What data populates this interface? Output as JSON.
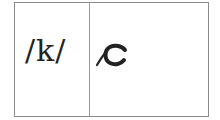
{
  "card": {
    "phoneme": "/k/",
    "glyph_icon": "cursive-c-letter",
    "border_color": "#8a8a8a",
    "text_color": "#222222"
  }
}
